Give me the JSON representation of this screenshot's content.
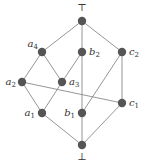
{
  "diagram": {
    "type": "hasse-diagram",
    "nodes": [
      {
        "id": "top",
        "label": "⊤",
        "sub": ""
      },
      {
        "id": "a4",
        "label": "a",
        "sub": "4"
      },
      {
        "id": "b2",
        "label": "b",
        "sub": "2"
      },
      {
        "id": "c2",
        "label": "c",
        "sub": "2"
      },
      {
        "id": "a2",
        "label": "a",
        "sub": "2"
      },
      {
        "id": "a3",
        "label": "a",
        "sub": "3"
      },
      {
        "id": "c1",
        "label": "c",
        "sub": "1"
      },
      {
        "id": "a1",
        "label": "a",
        "sub": "1"
      },
      {
        "id": "b1",
        "label": "b",
        "sub": "1"
      },
      {
        "id": "bot",
        "label": "⊥",
        "sub": ""
      }
    ],
    "edges": [
      [
        "top",
        "a4"
      ],
      [
        "top",
        "b2"
      ],
      [
        "top",
        "c2"
      ],
      [
        "a4",
        "a2"
      ],
      [
        "a4",
        "a3"
      ],
      [
        "b2",
        "a3"
      ],
      [
        "b2",
        "b1"
      ],
      [
        "c2",
        "b1"
      ],
      [
        "c2",
        "c1"
      ],
      [
        "a2",
        "a1"
      ],
      [
        "a2",
        "c1"
      ],
      [
        "a3",
        "a1"
      ],
      [
        "a1",
        "bot"
      ],
      [
        "b1",
        "bot"
      ],
      [
        "c1",
        "bot"
      ]
    ]
  }
}
